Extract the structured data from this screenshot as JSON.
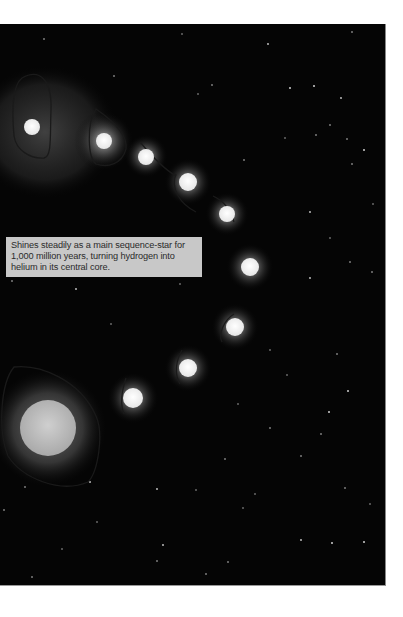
{
  "illustration": {
    "subject": "star life cycle sequence",
    "background_color": "#050505",
    "caption": "Shines steadily as a main sequence-star for 1,000 million years, turning hydrogen into helium in its central core.",
    "stages": [
      {
        "x": 32,
        "y": 103,
        "r": 8,
        "glow": 70
      },
      {
        "x": 104,
        "y": 117,
        "r": 8,
        "glow": 30
      },
      {
        "x": 146,
        "y": 132,
        "r": 8,
        "glow": 22
      },
      {
        "x": 188,
        "y": 158,
        "r": 9,
        "glow": 24
      },
      {
        "x": 227,
        "y": 190,
        "r": 8,
        "glow": 22
      },
      {
        "x": 250,
        "y": 243,
        "r": 9,
        "glow": 24
      },
      {
        "x": 235,
        "y": 303,
        "r": 9,
        "glow": 24
      },
      {
        "x": 188,
        "y": 344,
        "r": 9,
        "glow": 24
      },
      {
        "x": 133,
        "y": 374,
        "r": 10,
        "glow": 26
      },
      {
        "x": 48,
        "y": 404,
        "r": 28,
        "glow": 55
      }
    ]
  }
}
